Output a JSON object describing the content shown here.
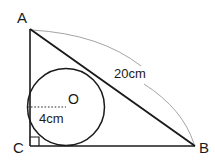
{
  "figure": {
    "type": "geometry-diagram",
    "background_color": "#ffffff",
    "stroke_color": "#1a1a1a",
    "annotation_color": "#9a9a9a",
    "dash_color": "#2b2b2b"
  },
  "labels": {
    "vertex_a": "A",
    "vertex_b": "B",
    "vertex_c": "C",
    "center_o": "O",
    "radius_measure": "4cm",
    "hypotenuse_measure": "20cm"
  },
  "geometry": {
    "triangle": {
      "a": {
        "x": 30,
        "y": 29
      },
      "b": {
        "x": 195,
        "y": 146
      },
      "c": {
        "x": 30,
        "y": 146
      }
    },
    "incircle": {
      "cx": 66,
      "cy": 107,
      "r": 38.5
    },
    "radius_line": {
      "x1": 27.5,
      "y1": 107,
      "x2": 66,
      "y2": 107
    },
    "right_angle_marker": {
      "x": 30,
      "y": 137,
      "size": 9
    },
    "arc_upper": "M 32 30 Q 100 34 141 66",
    "arc_lower": "M 144 84 Q 183 109 194 144"
  },
  "label_positions": {
    "vertex_a": {
      "x": 22,
      "y": 23
    },
    "vertex_b": {
      "x": 199,
      "y": 153
    },
    "vertex_c": {
      "x": 13,
      "y": 153
    },
    "center_o": {
      "x": 68,
      "y": 104
    },
    "radius_measure": {
      "x": 39,
      "y": 123
    },
    "hypotenuse_measure": {
      "x": 114,
      "y": 78
    }
  }
}
